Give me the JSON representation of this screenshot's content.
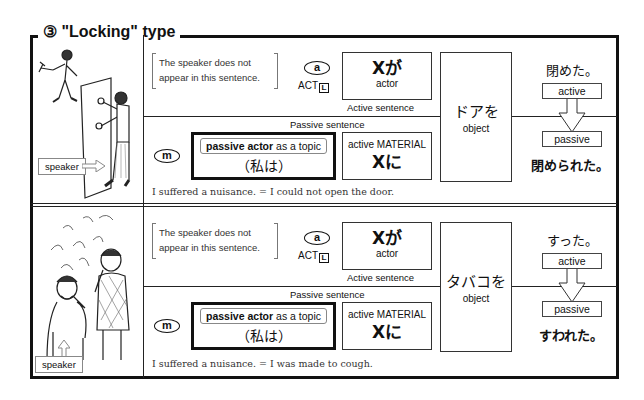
{
  "title": "③ \"Locking\" type",
  "sections": [
    {
      "id": "door",
      "illustration": "man walking away with keys; speaker trying to open a locked door",
      "speaker_label": "speaker",
      "bracket_note_line1": "The speaker does not",
      "bracket_note_line2": "appear in this sentence.",
      "active_marker": "a",
      "act_label": "ACT",
      "act_l": "L",
      "actor_jp": "Xが",
      "actor_en": "actor",
      "active_sentence_label": "Active  sentence",
      "passive_sentence_label": "Passive  sentence",
      "passive_marker": "m",
      "topic_tag_bold": "passive actor",
      "topic_tag_rest": " as a topic",
      "topic_jp": "（私は）",
      "material_en": "active MATERIAL",
      "material_jp": "Xに",
      "object_jp": "ドアを",
      "object_en": "object",
      "verb_active": "閉めた。",
      "active_tag": "active",
      "passive_tag": "passive",
      "verb_passive": "閉められた。",
      "caption": "I suffered a nuisance. = I could not open the door."
    },
    {
      "id": "smoke",
      "illustration": "speaker covering mouth coughing while another man smokes",
      "speaker_label": "speaker",
      "bracket_note_line1": "The speaker does not",
      "bracket_note_line2": "appear in this sentence.",
      "active_marker": "a",
      "act_label": "ACT",
      "act_l": "L",
      "actor_jp": "Xが",
      "actor_en": "actor",
      "active_sentence_label": "Active  sentence",
      "passive_sentence_label": "Passive  sentence",
      "passive_marker": "m",
      "topic_tag_bold": "passive actor",
      "topic_tag_rest": " as a topic",
      "topic_jp": "（私は）",
      "material_en": "active MATERIAL",
      "material_jp": "Xに",
      "object_jp": "タバコを",
      "object_en": "object",
      "verb_active": "すった。",
      "active_tag": "active",
      "passive_tag": "passive",
      "verb_passive": "すわれた。",
      "caption": "I suffered a nuisance. = I was made to cough."
    }
  ]
}
